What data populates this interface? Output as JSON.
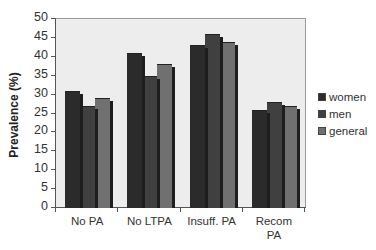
{
  "chart_data": {
    "type": "bar",
    "title": "",
    "xlabel": "",
    "ylabel": "Prevalence (%)",
    "ylim": [
      0,
      50
    ],
    "yticks": [
      0,
      5,
      10,
      15,
      20,
      25,
      30,
      35,
      40,
      45,
      50
    ],
    "categories": [
      "No PA",
      "No LTPA",
      "Insuff. PA",
      "Recom PA"
    ],
    "series": [
      {
        "name": "women",
        "color": "#2b2b2b",
        "values": [
          31,
          41,
          43,
          26
        ]
      },
      {
        "name": "men",
        "color": "#404040",
        "values": [
          27,
          35,
          46,
          28
        ]
      },
      {
        "name": "general",
        "color": "#707070",
        "values": [
          29,
          38,
          44,
          27
        ]
      }
    ],
    "legend_position": "right",
    "grid": false
  },
  "labels": {
    "ylabel": "Prevalence (%)",
    "categories": [
      "No PA",
      "No LTPA",
      "Insuff. PA",
      "Recom\nPA"
    ],
    "legend": [
      "women",
      "men",
      "general"
    ]
  }
}
